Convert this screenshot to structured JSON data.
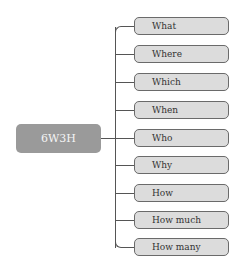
{
  "diagram": {
    "root": {
      "label": "6W3H"
    },
    "nodes": [
      {
        "label": "What",
        "top": 17
      },
      {
        "label": "Where",
        "top": 45
      },
      {
        "label": "Which",
        "top": 73
      },
      {
        "label": "When",
        "top": 101
      },
      {
        "label": "Who",
        "top": 129
      },
      {
        "label": "Why",
        "top": 156
      },
      {
        "label": "How",
        "top": 184
      },
      {
        "label": "How much",
        "top": 211
      },
      {
        "label": "How many",
        "top": 238
      }
    ]
  }
}
